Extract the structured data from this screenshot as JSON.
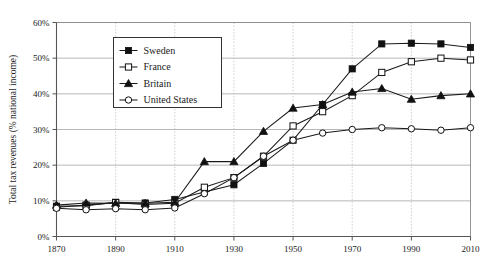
{
  "chart_data": {
    "type": "line",
    "title": "",
    "xlabel": "",
    "ylabel": "Total tax revenues (% national income)",
    "xlim": [
      1870,
      2010
    ],
    "ylim": [
      0,
      60
    ],
    "xticks": [
      1870,
      1890,
      1910,
      1930,
      1950,
      1970,
      1990,
      2010
    ],
    "xtick_labels": [
      "1870",
      "1890",
      "1910",
      "1930",
      "1950",
      "1970",
      "1990",
      "2010"
    ],
    "yticks": [
      0,
      10,
      20,
      30,
      40,
      50,
      60
    ],
    "ytick_labels": [
      "0%",
      "10%",
      "20%",
      "30%",
      "40%",
      "50%",
      "60%"
    ],
    "grid": "horizontal-solid-and-vertical-dotted",
    "legend_position": "upper-left-inside",
    "x": [
      1870,
      1880,
      1890,
      1900,
      1910,
      1920,
      1930,
      1940,
      1950,
      1960,
      1970,
      1980,
      1990,
      2000,
      2010
    ],
    "series": [
      {
        "name": "Sweden",
        "marker": "filled-square",
        "values": [
          8.5,
          8.6,
          9.6,
          9.4,
          10.4,
          12.5,
          14.5,
          20.5,
          27.0,
          37.0,
          47.0,
          54.0,
          54.2,
          54.0,
          53.0
        ]
      },
      {
        "name": "France",
        "marker": "open-square",
        "values": [
          8.2,
          8.8,
          9.5,
          9.0,
          9.3,
          13.8,
          16.5,
          22.5,
          31.0,
          35.0,
          39.5,
          46.0,
          49.0,
          50.0,
          49.5
        ]
      },
      {
        "name": "Britain",
        "marker": "filled-triangle",
        "values": [
          8.8,
          9.4,
          9.3,
          9.3,
          9.6,
          21.0,
          21.0,
          29.5,
          36.0,
          37.0,
          40.5,
          41.5,
          38.5,
          39.5,
          40.0
        ]
      },
      {
        "name": "United States",
        "marker": "open-circle",
        "values": [
          7.9,
          7.5,
          7.8,
          7.5,
          8.0,
          12.0,
          16.5,
          22.5,
          27.0,
          29.0,
          30.0,
          30.5,
          30.2,
          29.8,
          30.5
        ]
      }
    ]
  },
  "legend": {
    "entries": [
      {
        "label": "Sweden",
        "marker": "filled-square"
      },
      {
        "label": "France",
        "marker": "open-square"
      },
      {
        "label": "Britain",
        "marker": "filled-triangle"
      },
      {
        "label": "United States",
        "marker": "open-circle"
      }
    ]
  }
}
